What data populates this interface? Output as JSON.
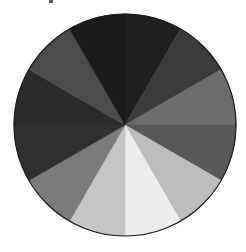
{
  "image": {
    "description": "Grayscale value wheel divided into 12 equal sectors",
    "background": "#ffffff",
    "outline_color": "#1a1a1a"
  },
  "wheel": {
    "center": [
      125,
      125
    ],
    "radius": 111,
    "sector_count": 12,
    "sectors": [
      {
        "start_deg": 0,
        "end_deg": 30,
        "color": "#1f1f1f"
      },
      {
        "start_deg": 30,
        "end_deg": 60,
        "color": "#3b3b3b"
      },
      {
        "start_deg": 60,
        "end_deg": 90,
        "color": "#6c6c6c"
      },
      {
        "start_deg": 90,
        "end_deg": 120,
        "color": "#585858"
      },
      {
        "start_deg": 120,
        "end_deg": 150,
        "color": "#bdbdbd"
      },
      {
        "start_deg": 150,
        "end_deg": 180,
        "color": "#ededed"
      },
      {
        "start_deg": 180,
        "end_deg": 210,
        "color": "#c6c6c6"
      },
      {
        "start_deg": 210,
        "end_deg": 240,
        "color": "#7b7b7b"
      },
      {
        "start_deg": 240,
        "end_deg": 270,
        "color": "#2f2f2f"
      },
      {
        "start_deg": 270,
        "end_deg": 300,
        "color": "#2b2b2b"
      },
      {
        "start_deg": 300,
        "end_deg": 330,
        "color": "#4b4b4b"
      },
      {
        "start_deg": 330,
        "end_deg": 360,
        "color": "#1b1b1b"
      }
    ]
  }
}
